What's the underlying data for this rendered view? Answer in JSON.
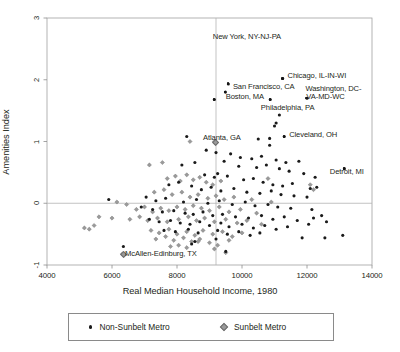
{
  "chart_data": {
    "type": "scatter",
    "title": "",
    "xlabel": "Real Median Household Income, 1980",
    "ylabel": "Amenities Index",
    "xlim": [
      4000,
      14000
    ],
    "ylim": [
      -1,
      3
    ],
    "xticks": [
      "4000",
      "6000",
      "8000",
      "10000",
      "12000",
      "14000"
    ],
    "yticks": [
      "-1",
      "0",
      "1",
      "2",
      "3"
    ],
    "grid": false,
    "reference_lines": {
      "horizontal_y": 0,
      "vertical_x": 9200
    },
    "legend": {
      "position": "below-axes",
      "entries": [
        {
          "label": "Non-Sunbelt Metro",
          "marker": "filled-circle",
          "color": "#1a1a1a"
        },
        {
          "label": "Sunbelt Metro",
          "marker": "diamond",
          "color": "#9a9a9a"
        }
      ]
    },
    "annotations": [
      {
        "label": "New York, NY-NJ-PA",
        "x": 9150,
        "y": 1.68,
        "marker": "filled-circle",
        "label_x": 9100,
        "label_y": 2.68,
        "anchor": "start"
      },
      {
        "label": "Chicago, IL-IN-WI",
        "x": 11250,
        "y": 2.02,
        "marker": "filled-circle",
        "label_x": 11400,
        "label_y": 2.06,
        "anchor": "start"
      },
      {
        "label": "San Francisco, CA",
        "x": 9580,
        "y": 1.93,
        "marker": "filled-circle",
        "label_x": 9720,
        "label_y": 1.87,
        "anchor": "start"
      },
      {
        "label": "Boston, MA",
        "x": 9490,
        "y": 1.8,
        "marker": "filled-circle",
        "label_x": 9500,
        "label_y": 1.72,
        "anchor": "start"
      },
      {
        "label": "Washington, DC-",
        "x": 12000,
        "y": 1.7,
        "marker": "filled-circle",
        "label_x": 11950,
        "label_y": 1.85,
        "anchor": "start"
      },
      {
        "label": "VA-MD-WC",
        "x": null,
        "y": null,
        "marker": "none",
        "label_x": 11980,
        "label_y": 1.72,
        "anchor": "start"
      },
      {
        "label": "Philadelphia, PA",
        "x": 10870,
        "y": 1.68,
        "marker": "filled-circle",
        "label_x": 10580,
        "label_y": 1.53,
        "anchor": "start"
      },
      {
        "label": "Cleveland, OH",
        "x": 11300,
        "y": 1.08,
        "marker": "filled-circle",
        "label_x": 11450,
        "label_y": 1.1,
        "anchor": "start"
      },
      {
        "label": "Atlanta, GA",
        "x": 9150,
        "y": 1.0,
        "marker": "diamond",
        "label_x": 8800,
        "label_y": 1.05,
        "anchor": "start"
      },
      {
        "label": "Detroit, MI",
        "x": 13150,
        "y": 0.56,
        "marker": "filled-circle",
        "label_x": 12700,
        "label_y": 0.49,
        "anchor": "start"
      },
      {
        "label": "McAllen-Edinburg, TX",
        "x": 6320,
        "y": -0.82,
        "marker": "diamond",
        "label_x": 6400,
        "label_y": -0.83,
        "anchor": "start"
      }
    ],
    "series": [
      {
        "name": "Non-Sunbelt Metro",
        "marker": "filled-circle",
        "color": "#1a1a1a",
        "points": [
          [
            9150,
            1.68
          ],
          [
            11250,
            2.02
          ],
          [
            9580,
            1.93
          ],
          [
            9490,
            1.8
          ],
          [
            12000,
            1.7
          ],
          [
            10870,
            1.68
          ],
          [
            11300,
            1.08
          ],
          [
            13150,
            0.56
          ],
          [
            11150,
            1.43
          ],
          [
            11000,
            1.25
          ],
          [
            11050,
            1.3
          ],
          [
            10850,
            1.05
          ],
          [
            10500,
            1.04
          ],
          [
            8300,
            1.08
          ],
          [
            8900,
            0.86
          ],
          [
            9200,
            0.82
          ],
          [
            9650,
            0.8
          ],
          [
            9950,
            0.74
          ],
          [
            10850,
            0.94
          ],
          [
            10300,
            0.72
          ],
          [
            10600,
            0.76
          ],
          [
            11050,
            0.7
          ],
          [
            11350,
            0.66
          ],
          [
            11750,
            0.68
          ],
          [
            9450,
            0.68
          ],
          [
            9900,
            0.6
          ],
          [
            10450,
            0.58
          ],
          [
            10750,
            0.62
          ],
          [
            11150,
            0.56
          ],
          [
            11450,
            0.52
          ],
          [
            11900,
            0.48
          ],
          [
            12250,
            0.42
          ],
          [
            8150,
            0.62
          ],
          [
            8550,
            0.66
          ],
          [
            8850,
            0.46
          ],
          [
            9250,
            0.48
          ],
          [
            9550,
            0.44
          ],
          [
            9150,
            0.42
          ],
          [
            10050,
            0.38
          ],
          [
            10350,
            0.4
          ],
          [
            10650,
            0.34
          ],
          [
            10950,
            0.3
          ],
          [
            11250,
            0.28
          ],
          [
            11550,
            0.32
          ],
          [
            12100,
            0.24
          ],
          [
            12300,
            0.26
          ],
          [
            7750,
            0.3
          ],
          [
            8050,
            0.34
          ],
          [
            8450,
            0.28
          ],
          [
            8750,
            0.22
          ],
          [
            9050,
            0.26
          ],
          [
            9350,
            0.2
          ],
          [
            9750,
            0.24
          ],
          [
            10150,
            0.18
          ],
          [
            10550,
            0.16
          ],
          [
            10900,
            0.2
          ],
          [
            11200,
            0.14
          ],
          [
            11600,
            0.12
          ],
          [
            12000,
            0.1
          ],
          [
            5900,
            0.06
          ],
          [
            7050,
            0.1
          ],
          [
            7350,
            0.04
          ],
          [
            7650,
            0.08
          ],
          [
            8200,
            0.02
          ],
          [
            8600,
            0.06
          ],
          [
            8950,
            0.0
          ],
          [
            9300,
            0.04
          ],
          [
            9700,
            -0.02
          ],
          [
            10100,
            0.02
          ],
          [
            10400,
            -0.04
          ],
          [
            10800,
            -0.02
          ],
          [
            11100,
            -0.06
          ],
          [
            11500,
            -0.08
          ],
          [
            12150,
            -0.1
          ],
          [
            6900,
            -0.06
          ],
          [
            7250,
            -0.1
          ],
          [
            7550,
            -0.14
          ],
          [
            7900,
            -0.12
          ],
          [
            8250,
            -0.16
          ],
          [
            8500,
            -0.18
          ],
          [
            8800,
            -0.14
          ],
          [
            9100,
            -0.2
          ],
          [
            9400,
            -0.18
          ],
          [
            9800,
            -0.22
          ],
          [
            10200,
            -0.24
          ],
          [
            10600,
            -0.2
          ],
          [
            10950,
            -0.26
          ],
          [
            11300,
            -0.22
          ],
          [
            11700,
            -0.28
          ],
          [
            12200,
            -0.24
          ],
          [
            12450,
            -0.2
          ],
          [
            7150,
            -0.26
          ],
          [
            7450,
            -0.3
          ],
          [
            7800,
            -0.28
          ],
          [
            8100,
            -0.32
          ],
          [
            8400,
            -0.34
          ],
          [
            8700,
            -0.3
          ],
          [
            9000,
            -0.36
          ],
          [
            9350,
            -0.32
          ],
          [
            9600,
            -0.38
          ],
          [
            10000,
            -0.34
          ],
          [
            10350,
            -0.4
          ],
          [
            10700,
            -0.36
          ],
          [
            11050,
            -0.42
          ],
          [
            11400,
            -0.38
          ],
          [
            12050,
            -0.34
          ],
          [
            12600,
            -0.3
          ],
          [
            7600,
            -0.44
          ],
          [
            7950,
            -0.46
          ],
          [
            8350,
            -0.42
          ],
          [
            8650,
            -0.48
          ],
          [
            9250,
            -0.44
          ],
          [
            9550,
            -0.5
          ],
          [
            9900,
            -0.46
          ],
          [
            10250,
            -0.52
          ],
          [
            10550,
            -0.48
          ],
          [
            11850,
            -0.56
          ],
          [
            12550,
            -0.56
          ],
          [
            13100,
            -0.52
          ],
          [
            6350,
            -0.7
          ],
          [
            8550,
            -0.62
          ],
          [
            9200,
            -0.58
          ],
          [
            9500,
            -0.78
          ],
          [
            8450,
            -0.66
          ]
        ]
      },
      {
        "name": "Sunbelt Metro",
        "marker": "diamond",
        "color": "#9a9a9a",
        "points": [
          [
            9150,
            1.0
          ],
          [
            8400,
            1.0
          ],
          [
            6320,
            -0.82
          ],
          [
            7150,
            0.62
          ],
          [
            7550,
            0.66
          ],
          [
            7700,
            0.4
          ],
          [
            7950,
            0.44
          ],
          [
            8100,
            0.36
          ],
          [
            8300,
            0.46
          ],
          [
            8500,
            0.38
          ],
          [
            8700,
            0.42
          ],
          [
            8900,
            0.34
          ],
          [
            9100,
            0.3
          ],
          [
            9350,
            0.36
          ],
          [
            10800,
            0.4
          ],
          [
            12100,
            0.3
          ],
          [
            12200,
            0.22
          ],
          [
            7300,
            0.18
          ],
          [
            7600,
            0.22
          ],
          [
            7850,
            0.14
          ],
          [
            8150,
            0.18
          ],
          [
            8400,
            0.1
          ],
          [
            8650,
            0.14
          ],
          [
            8950,
            0.08
          ],
          [
            9200,
            0.12
          ],
          [
            9450,
            0.06
          ],
          [
            9750,
            0.1
          ],
          [
            10300,
            0.06
          ],
          [
            10900,
            0.02
          ],
          [
            6150,
            0.02
          ],
          [
            6450,
            -0.02
          ],
          [
            6750,
            -0.1
          ],
          [
            7000,
            -0.06
          ],
          [
            7250,
            -0.14
          ],
          [
            7500,
            -0.08
          ],
          [
            7750,
            -0.12
          ],
          [
            8000,
            -0.06
          ],
          [
            8250,
            -0.1
          ],
          [
            8500,
            -0.04
          ],
          [
            8750,
            -0.08
          ],
          [
            9000,
            -0.12
          ],
          [
            9300,
            -0.06
          ],
          [
            9600,
            -0.14
          ],
          [
            9950,
            -0.1
          ],
          [
            10450,
            -0.16
          ],
          [
            5150,
            -0.4
          ],
          [
            5300,
            -0.42
          ],
          [
            5450,
            -0.36
          ],
          [
            5600,
            -0.22
          ],
          [
            6000,
            -0.24
          ],
          [
            6550,
            -0.26
          ],
          [
            6850,
            -0.22
          ],
          [
            7100,
            -0.28
          ],
          [
            7400,
            -0.24
          ],
          [
            7700,
            -0.3
          ],
          [
            8050,
            -0.26
          ],
          [
            8350,
            -0.22
          ],
          [
            8600,
            -0.28
          ],
          [
            8850,
            -0.24
          ],
          [
            9150,
            -0.3
          ],
          [
            9500,
            -0.26
          ],
          [
            9850,
            -0.32
          ],
          [
            10150,
            -0.28
          ],
          [
            10600,
            -0.34
          ],
          [
            7200,
            -0.44
          ],
          [
            7450,
            -0.48
          ],
          [
            7750,
            -0.42
          ],
          [
            8000,
            -0.5
          ],
          [
            8300,
            -0.46
          ],
          [
            8550,
            -0.52
          ],
          [
            8800,
            -0.44
          ],
          [
            9100,
            -0.5
          ],
          [
            9400,
            -0.46
          ],
          [
            9700,
            -0.54
          ],
          [
            10000,
            -0.48
          ],
          [
            7350,
            -0.58
          ],
          [
            7650,
            -0.54
          ],
          [
            7900,
            -0.6
          ],
          [
            8200,
            -0.56
          ],
          [
            8450,
            -0.62
          ],
          [
            8700,
            -0.58
          ],
          [
            9000,
            -0.64
          ],
          [
            9600,
            -0.6
          ],
          [
            7800,
            -0.7
          ],
          [
            8050,
            -0.68
          ],
          [
            8300,
            -0.72
          ],
          [
            9150,
            -0.74
          ],
          [
            9500,
            -0.8
          ],
          [
            8650,
            -0.62
          ],
          [
            9250,
            -0.68
          ]
        ]
      }
    ]
  }
}
